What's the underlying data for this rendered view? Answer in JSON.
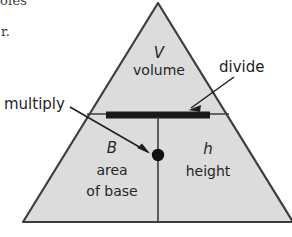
{
  "page": {
    "width": 292,
    "height": 237,
    "background_color": "#ffffff",
    "cropped_body_text_top": "oles",
    "cropped_body_text_second": "r."
  },
  "diagram": {
    "type": "formula-triangle",
    "title_text": "",
    "shape": {
      "name": "triangle",
      "fill_color": "#dcdcdc",
      "stroke_color": "#3d3d3d",
      "apex": [
        158,
        3
      ],
      "bottom_left": [
        23,
        222
      ],
      "bottom_right": [
        293,
        222
      ]
    },
    "top_cell": {
      "symbol": "V",
      "word": "volume"
    },
    "bottom_left_cell": {
      "symbol": "B",
      "word_line1": "area",
      "word_line2": "of base"
    },
    "bottom_right_cell": {
      "symbol": "h",
      "word": "height"
    },
    "divider_bar": {
      "name": "horizontal-divider-bar",
      "color": "#1a1a1a",
      "x1": 106,
      "x2": 210,
      "y": 115,
      "thickness": 7
    },
    "vertical_divider": {
      "name": "vertical-divider-line",
      "color": "#3d3d3d",
      "x": 158,
      "y1": 118,
      "y2": 222
    },
    "horizontal_rule": {
      "name": "horizontal-thin-rule",
      "color": "#3d3d3d",
      "y": 114
    },
    "operation_dot": {
      "name": "multiply-dot",
      "color": "#111111",
      "cx": 158,
      "cy": 155,
      "r": 6
    },
    "callouts": [
      {
        "id": "multiply",
        "label": "multiply",
        "points_to": "multiply-dot",
        "arrow_from": [
          70,
          107
        ],
        "arrow_to": [
          150,
          152
        ]
      },
      {
        "id": "divide",
        "label": "divide",
        "points_to": "horizontal-divider-bar",
        "arrow_from": [
          234,
          77
        ],
        "arrow_to": [
          189,
          110
        ]
      }
    ]
  }
}
